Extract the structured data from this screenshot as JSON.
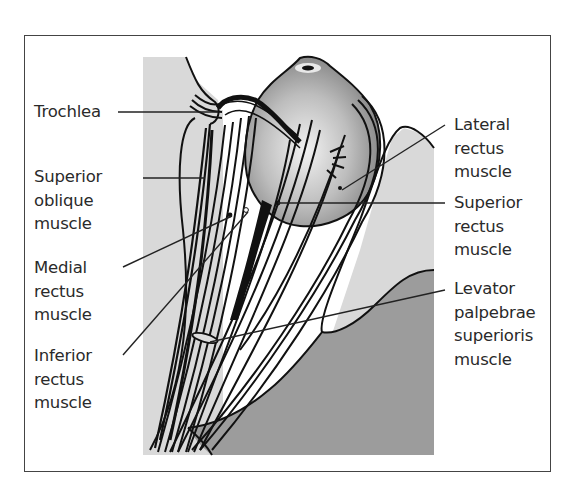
{
  "figure": {
    "colors": {
      "light_gray": "#d9d9d9",
      "dark_gray": "#9c9c9c",
      "line": "#111111",
      "frame": "#444444"
    }
  },
  "labels_left": [
    {
      "id": "trochlea",
      "lines": [
        "Trochlea"
      ]
    },
    {
      "id": "superior-oblique",
      "lines": [
        "Superior",
        "oblique",
        "muscle"
      ]
    },
    {
      "id": "medial-rectus",
      "lines": [
        "Medial",
        "rectus",
        "muscle"
      ]
    },
    {
      "id": "inferior-rectus",
      "lines": [
        "Inferior",
        "rectus",
        "muscle"
      ]
    }
  ],
  "labels_right": [
    {
      "id": "lateral-rectus",
      "lines": [
        "Lateral",
        "rectus",
        "muscle"
      ]
    },
    {
      "id": "superior-rectus",
      "lines": [
        "Superior",
        "rectus",
        "muscle"
      ]
    },
    {
      "id": "levator",
      "lines": [
        "Levator",
        "palpebrae",
        "superioris",
        "muscle"
      ]
    }
  ]
}
